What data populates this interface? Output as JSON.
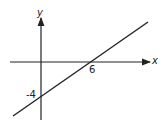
{
  "diagram": {
    "type": "coordinate-graph",
    "axes": {
      "x_label": "x",
      "y_label": "y"
    },
    "line": {
      "x_intercept": "6",
      "y_intercept": "-4"
    },
    "colors": {
      "stroke": "#222222",
      "background": "#ffffff"
    }
  }
}
